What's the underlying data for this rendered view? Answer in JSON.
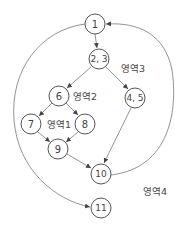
{
  "diagram": {
    "type": "control-flow-graph",
    "nodes": [
      {
        "id": "n1",
        "label": "1",
        "x": 95,
        "y": 24
      },
      {
        "id": "n23",
        "label": "2, 3",
        "x": 99,
        "y": 59
      },
      {
        "id": "n6",
        "label": "6",
        "x": 59,
        "y": 96
      },
      {
        "id": "n45",
        "label": "4, 5",
        "x": 135,
        "y": 98
      },
      {
        "id": "n7",
        "label": "7",
        "x": 31,
        "y": 124
      },
      {
        "id": "n8",
        "label": "8",
        "x": 85,
        "y": 124
      },
      {
        "id": "n9",
        "label": "9",
        "x": 58,
        "y": 149
      },
      {
        "id": "n10",
        "label": "10",
        "x": 101,
        "y": 174
      },
      {
        "id": "n11",
        "label": "11",
        "x": 101,
        "y": 208
      }
    ],
    "edges": [
      {
        "from": "1",
        "to": "2, 3"
      },
      {
        "from": "2, 3",
        "to": "6"
      },
      {
        "from": "2, 3",
        "to": "4, 5"
      },
      {
        "from": "6",
        "to": "7"
      },
      {
        "from": "6",
        "to": "8"
      },
      {
        "from": "7",
        "to": "9"
      },
      {
        "from": "8",
        "to": "9"
      },
      {
        "from": "9",
        "to": "10"
      },
      {
        "from": "4, 5",
        "to": "10"
      },
      {
        "from": "10",
        "to": "1"
      },
      {
        "from": "1",
        "to": "11"
      }
    ],
    "regions": [
      {
        "label": "영역1",
        "x": 59,
        "y": 124
      },
      {
        "label": "영역2",
        "x": 85,
        "y": 96
      },
      {
        "label": "영역3",
        "x": 133,
        "y": 68
      },
      {
        "label": "영역4",
        "x": 155,
        "y": 191
      }
    ]
  }
}
